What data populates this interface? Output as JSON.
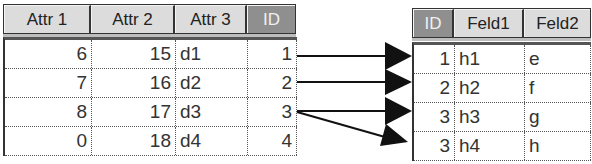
{
  "left_table": {
    "headers": [
      {
        "label": "Attr 1",
        "key": false
      },
      {
        "label": "Attr 2",
        "key": false
      },
      {
        "label": "Attr 3",
        "key": false
      },
      {
        "label": "ID",
        "key": true
      }
    ],
    "rows": [
      [
        "6",
        "15",
        "d1",
        "1"
      ],
      [
        "7",
        "16",
        "d2",
        "2"
      ],
      [
        "8",
        "17",
        "d3",
        "3"
      ],
      [
        "0",
        "18",
        "d4",
        "4"
      ]
    ]
  },
  "right_table": {
    "headers": [
      {
        "label": "ID",
        "key": true
      },
      {
        "label": "Feld1",
        "key": false
      },
      {
        "label": "Feld2",
        "key": false
      }
    ],
    "rows": [
      [
        "1",
        "h1",
        "e"
      ],
      [
        "2",
        "h2",
        "f"
      ],
      [
        "3",
        "h3",
        "g"
      ],
      [
        "3",
        "h4",
        "h"
      ]
    ]
  },
  "relations": [
    {
      "from_row": 0,
      "to_row": 0
    },
    {
      "from_row": 1,
      "to_row": 1
    },
    {
      "from_row": 2,
      "to_row": 2
    },
    {
      "from_row": 2,
      "to_row": 3
    }
  ],
  "colors": {
    "header_bg": "#dcdcdc",
    "key_header_bg": "#8f8f8f",
    "border": "#333333"
  }
}
